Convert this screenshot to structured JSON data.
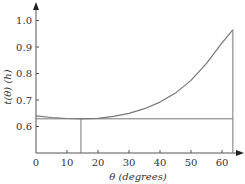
{
  "chart_data": {
    "type": "line",
    "title": "",
    "xlabel": "θ (degrees)",
    "ylabel": "t(θ) (h)",
    "xlim": [
      0,
      65
    ],
    "ylim": [
      0.5,
      1.08
    ],
    "x_ticks": [
      0,
      10,
      20,
      30,
      40,
      50,
      60
    ],
    "y_ticks": [
      0.6,
      0.7,
      0.8,
      0.9,
      1.0
    ],
    "x_tick_labels": [
      "0",
      "10",
      "20",
      "30",
      "40",
      "50",
      "60"
    ],
    "y_tick_labels": [
      "0.6",
      "0.7",
      "0.8",
      "0.9",
      "1.0"
    ],
    "grid": false,
    "series": [
      {
        "name": "t(θ)",
        "x": [
          0,
          5,
          10,
          14.5,
          20,
          25,
          30,
          35,
          40,
          45,
          50,
          55,
          60,
          63.5
        ],
        "values": [
          0.64,
          0.634,
          0.63,
          0.629,
          0.631,
          0.638,
          0.65,
          0.667,
          0.692,
          0.726,
          0.774,
          0.838,
          0.916,
          0.965
        ]
      }
    ],
    "annotations": [
      {
        "type": "hline",
        "y": 0.629,
        "x_from": 0,
        "x_to": 63.5,
        "label": "minimum time"
      },
      {
        "type": "vline",
        "x": 14.5,
        "y_from": 0.5,
        "y_to": 0.629,
        "label": "angle at minimum"
      },
      {
        "type": "vline",
        "x": 63.5,
        "y_from": 0.5,
        "y_to": 0.965,
        "label": "right boundary"
      }
    ]
  },
  "labels": {
    "xlabel": "θ (degrees)",
    "ylabel": "t(θ) (h)"
  }
}
